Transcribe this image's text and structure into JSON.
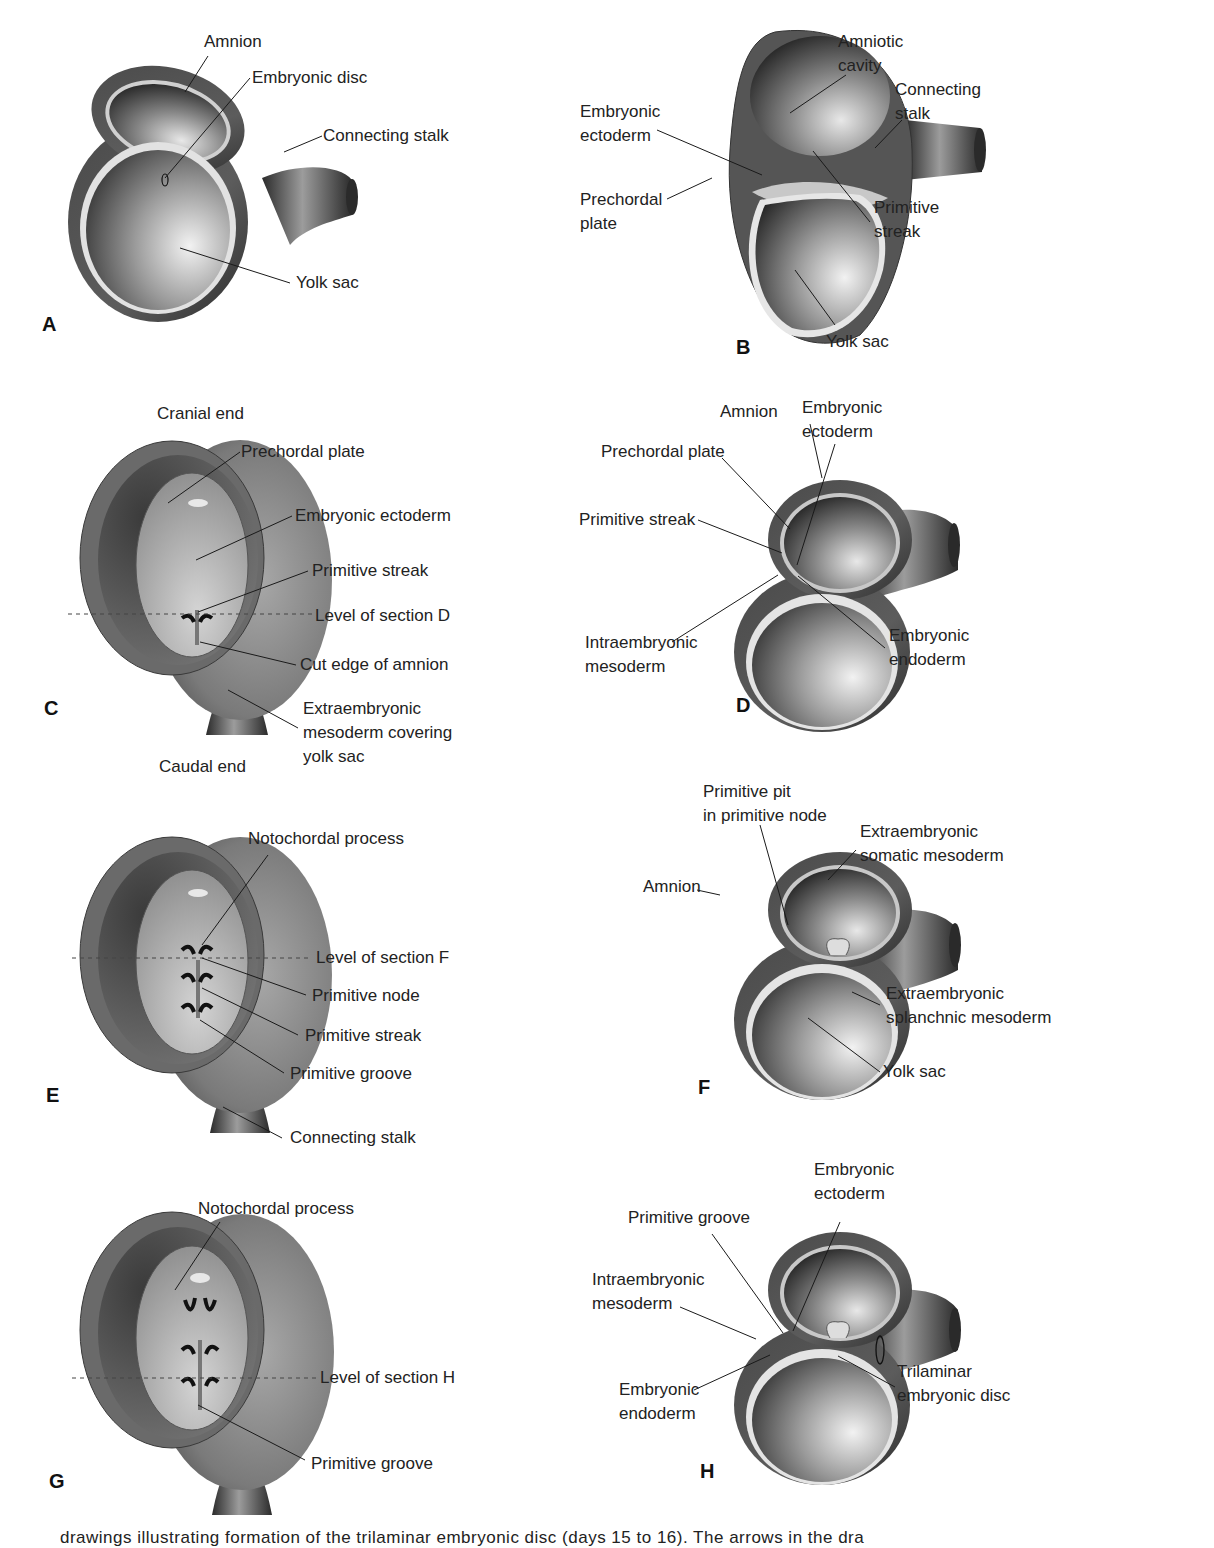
{
  "figure": {
    "panels": [
      {
        "id": "A",
        "letter": "A",
        "labels": {
          "amnion": "Amnion",
          "embryonic_disc": "Embryonic disc",
          "connecting_stalk": "Connecting stalk",
          "yolk_sac": "Yolk sac"
        }
      },
      {
        "id": "B",
        "letter": "B",
        "labels": {
          "amniotic_cavity": "Amniotic\ncavity",
          "connecting_stalk": "Connecting\nstalk",
          "embryonic_ectoderm": "Embryonic\nectoderm",
          "prechordal_plate": "Prechordal\nplate",
          "primitive_streak": "Primitive\nstreak",
          "yolk_sac": "Yolk sac"
        }
      },
      {
        "id": "C",
        "letter": "C",
        "labels": {
          "cranial_end": "Cranial end",
          "prechordal_plate": "Prechordal plate",
          "embryonic_ectoderm": "Embryonic ectoderm",
          "primitive_streak": "Primitive streak",
          "level_of_section": "Level of section D",
          "cut_edge_of_amnion": "Cut edge of amnion",
          "extraembryonic_mesoderm": "Extraembryonic\nmesoderm covering\nyolk sac",
          "caudal_end": "Caudal end"
        }
      },
      {
        "id": "D",
        "letter": "D",
        "labels": {
          "amnion": "Amnion",
          "embryonic_ectoderm": "Embryonic\nectoderm",
          "prechordal_plate": "Prechordal plate",
          "primitive_streak": "Primitive streak",
          "intraembryonic_mesoderm": "Intraembryonic\nmesoderm",
          "embryonic_endoderm": "Embryonic\nendoderm"
        }
      },
      {
        "id": "E",
        "letter": "E",
        "labels": {
          "notochordal_process": "Notochordal process",
          "level_of_section": "Level of section F",
          "primitive_node": "Primitive node",
          "primitive_streak": "Primitive streak",
          "primitive_groove": "Primitive groove",
          "connecting_stalk": "Connecting stalk"
        }
      },
      {
        "id": "F",
        "letter": "F",
        "labels": {
          "primitive_pit": "Primitive pit\nin primitive node",
          "extraembryonic_somatic_mesoderm": "Extraembryonic\nsomatic mesoderm",
          "amnion": "Amnion",
          "extraembryonic_splanchnic_mesoderm": "Extraembryonic\nsplanchnic mesoderm",
          "yolk_sac": "Yolk sac"
        }
      },
      {
        "id": "G",
        "letter": "G",
        "labels": {
          "notochordal_process": "Notochordal process",
          "level_of_section": "Level of section H",
          "primitive_groove": "Primitive groove"
        }
      },
      {
        "id": "H",
        "letter": "H",
        "labels": {
          "embryonic_ectoderm": "Embryonic\nectoderm",
          "primitive_groove": "Primitive groove",
          "intraembryonic_mesoderm": "Intraembryonic\nmesoderm",
          "embryonic_endoderm": "Embryonic\nendoderm",
          "trilaminar_embryonic_disc": "Trilaminar\nembryonic disc"
        }
      }
    ],
    "caption": "drawings illustrating formation of the trilaminar embryonic disc (days 15 to 16). The arrows in the dra"
  },
  "colors": {
    "background": "#ffffff",
    "tissue_dark": "#3a3a3a",
    "tissue_mid": "#6b6b6b",
    "tissue_light": "#d8d8d8",
    "membrane_light": "#e6e6e6",
    "label_text": "#222222"
  }
}
